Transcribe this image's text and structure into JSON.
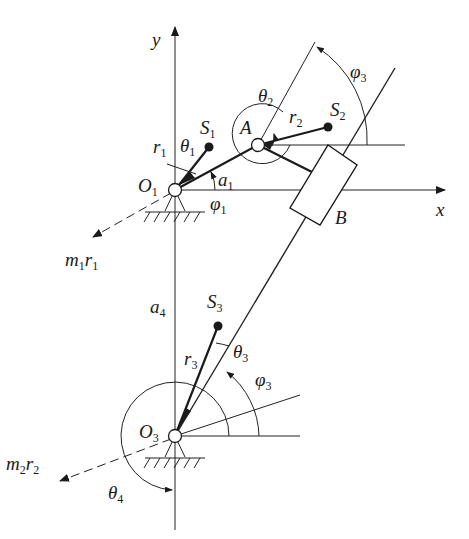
{
  "diagram": {
    "title": "",
    "axes": {
      "x_label": "x",
      "y_label": "y"
    },
    "points": {
      "O1": {
        "label": "O",
        "sub": "1"
      },
      "O3": {
        "label": "O",
        "sub": "3"
      },
      "A": {
        "label": "A"
      },
      "B": {
        "label": "B"
      },
      "S1": {
        "label": "S",
        "sub": "1"
      },
      "S2": {
        "label": "S",
        "sub": "2"
      },
      "S3": {
        "label": "S",
        "sub": "3"
      }
    },
    "lengths": {
      "r1": {
        "label": "r",
        "sub": "1"
      },
      "r2": {
        "label": "r",
        "sub": "2"
      },
      "r3": {
        "label": "r",
        "sub": "3"
      },
      "a1": {
        "label": "a",
        "sub": "1"
      },
      "a4": {
        "label": "a",
        "sub": "4"
      }
    },
    "angles": {
      "theta1": {
        "label": "θ",
        "sub": "1"
      },
      "theta2": {
        "label": "θ",
        "sub": "2"
      },
      "theta3": {
        "label": "θ",
        "sub": "3"
      },
      "theta4": {
        "label": "θ",
        "sub": "4"
      },
      "phi1": {
        "label": "φ",
        "sub": "1"
      },
      "phi3_top": {
        "label": "φ",
        "sub": "3"
      },
      "phi3_bottom": {
        "label": "φ",
        "sub": "3"
      }
    },
    "forces": {
      "m1r1": {
        "m": "m",
        "msub": "1",
        "r": "r",
        "rsub": "1"
      },
      "m2r2": {
        "m": "m",
        "msub": "2",
        "r": "r",
        "rsub": "2"
      }
    },
    "colors": {
      "ink": "#1a1a1a",
      "background": "#ffffff"
    }
  }
}
